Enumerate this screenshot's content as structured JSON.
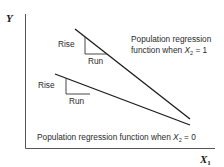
{
  "diagram": {
    "axes": {
      "y_label": "Y",
      "x_label": "X",
      "x_label_subscript": "1",
      "color": "#555555"
    },
    "lines": [
      {
        "name": "Population regression function when X2 = 1",
        "label_line1": "Population regression",
        "label_line2_prefix": "function when ",
        "label_var": "X",
        "label_sub": "2",
        "label_suffix": " = 1",
        "triangle": {
          "rise": "Rise",
          "run": "Run"
        }
      },
      {
        "name": "Population regression function when X2 = 0",
        "label_prefix": "Population regression function when ",
        "label_var": "X",
        "label_sub": "2",
        "label_suffix": " = 0",
        "triangle": {
          "rise": "Rise",
          "run": "Run"
        }
      }
    ],
    "line_color": "#1a1a1a"
  }
}
